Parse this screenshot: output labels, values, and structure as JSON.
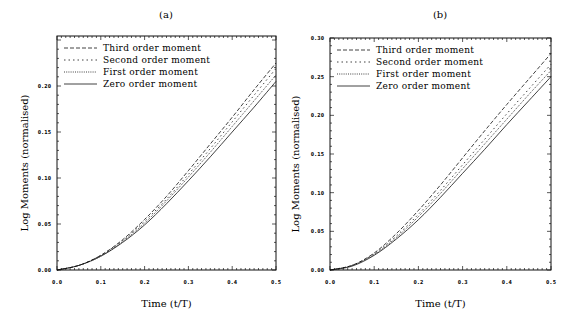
{
  "chart_data": [
    {
      "type": "line",
      "title": "(a)",
      "xlabel": "Time (t/T)",
      "ylabel": "Log Moments (normalised)",
      "xlim": [
        0,
        0.5
      ],
      "ylim": [
        0,
        0.25
      ],
      "xticks": [
        "0.0",
        "0.1",
        "0.2",
        "0.3",
        "0.4",
        "0.5"
      ],
      "yticks": [
        "0.00",
        "0.05",
        "0.10",
        "0.15",
        "0.20"
      ],
      "grid": false,
      "legend_position": "upper left",
      "x": [
        0.0,
        0.05,
        0.1,
        0.15,
        0.2,
        0.25,
        0.3,
        0.35,
        0.4,
        0.45,
        0.5
      ],
      "series": [
        {
          "name": "Third order moment",
          "style": "dashed",
          "values": [
            0.0,
            0.005,
            0.016,
            0.033,
            0.055,
            0.08,
            0.108,
            0.137,
            0.166,
            0.196,
            0.225
          ]
        },
        {
          "name": "Second order moment",
          "style": "sparse-dotted",
          "values": [
            0.0,
            0.005,
            0.016,
            0.032,
            0.053,
            0.077,
            0.104,
            0.132,
            0.161,
            0.19,
            0.219
          ]
        },
        {
          "name": "First order moment",
          "style": "dotted",
          "values": [
            0.0,
            0.005,
            0.015,
            0.031,
            0.051,
            0.075,
            0.101,
            0.128,
            0.156,
            0.184,
            0.212
          ]
        },
        {
          "name": "Zero order moment",
          "style": "solid",
          "values": [
            0.0,
            0.005,
            0.015,
            0.03,
            0.049,
            0.072,
            0.097,
            0.123,
            0.15,
            0.177,
            0.205
          ]
        }
      ]
    },
    {
      "type": "line",
      "title": "(b)",
      "xlabel": "Time (t/T)",
      "ylabel": "Log Moments (normalised)",
      "xlim": [
        0,
        0.5
      ],
      "ylim": [
        0,
        0.3
      ],
      "xticks": [
        "0.0",
        "0.1",
        "0.2",
        "0.3",
        "0.4",
        "0.5"
      ],
      "yticks": [
        "0.00",
        "0.05",
        "0.10",
        "0.15",
        "0.20",
        "0.25",
        "0.30"
      ],
      "grid": false,
      "legend_position": "upper left",
      "x": [
        0.0,
        0.05,
        0.1,
        0.15,
        0.2,
        0.25,
        0.3,
        0.35,
        0.4,
        0.45,
        0.5
      ],
      "series": [
        {
          "name": "Third order moment",
          "style": "dashed",
          "values": [
            0.0,
            0.006,
            0.022,
            0.047,
            0.077,
            0.11,
            0.145,
            0.18,
            0.214,
            0.247,
            0.28
          ]
        },
        {
          "name": "Second order moment",
          "style": "sparse-dotted",
          "values": [
            0.0,
            0.006,
            0.021,
            0.044,
            0.072,
            0.103,
            0.136,
            0.169,
            0.202,
            0.234,
            0.266
          ]
        },
        {
          "name": "First order moment",
          "style": "dotted",
          "values": [
            0.0,
            0.006,
            0.02,
            0.042,
            0.069,
            0.099,
            0.131,
            0.163,
            0.195,
            0.227,
            0.258
          ]
        },
        {
          "name": "Zero order moment",
          "style": "solid",
          "values": [
            0.0,
            0.005,
            0.019,
            0.04,
            0.065,
            0.094,
            0.125,
            0.156,
            0.188,
            0.219,
            0.25
          ]
        }
      ]
    }
  ],
  "panels": [
    {
      "title": "(a)",
      "xlabel": "Time (t/T)",
      "ylabel": "Log Moments (normalised)"
    },
    {
      "title": "(b)",
      "xlabel": "Time (t/T)",
      "ylabel": "Log Moments (normalised)"
    }
  ]
}
